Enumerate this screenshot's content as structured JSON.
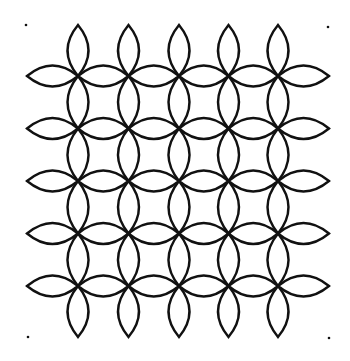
{
  "artwork": {
    "kind": "petal-grid-pattern",
    "background": "#ffffff",
    "stroke_color": "#111111",
    "stroke_width": 2.4,
    "grid": {
      "columns_x": [
        78,
        128.5,
        179,
        228.5,
        278
      ],
      "rows_y": [
        76,
        128.5,
        181,
        233.5,
        286
      ]
    },
    "petal_half_width": 10.5,
    "outer_petal_length": 51,
    "corner_dots": [
      {
        "x": 26,
        "y": 25
      },
      {
        "x": 328,
        "y": 27
      },
      {
        "x": 28,
        "y": 337
      },
      {
        "x": 329,
        "y": 338
      }
    ],
    "dot_radius": 1.3
  }
}
